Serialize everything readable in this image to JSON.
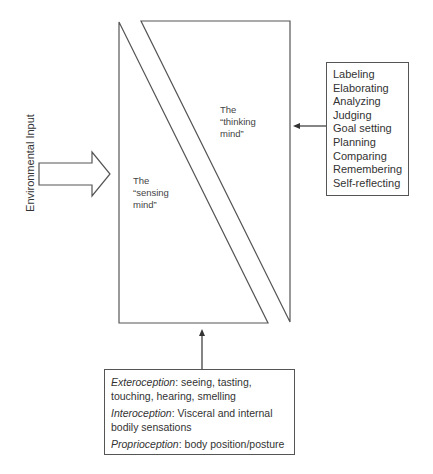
{
  "diagram": {
    "type": "conceptual-mind-model",
    "environmental_input": {
      "label": "Environmental Input"
    },
    "sensing_mind": {
      "line1": "The",
      "line2": "“sensing",
      "line3": "mind”"
    },
    "thinking_mind": {
      "line1": "The",
      "line2": "“thinking",
      "line3": "mind”"
    },
    "thinking_processes": {
      "items": [
        "Labeling",
        "Elaborating",
        "Analyzing",
        "Judging",
        "Goal setting",
        "Planning",
        "Comparing",
        "Remembering",
        "Self-reflecting"
      ]
    },
    "sensory_inputs": {
      "entries": [
        {
          "term": "Exteroception",
          "sep": ":",
          "text1": " seeing, tasting,",
          "text2": "touching, hearing, smelling"
        },
        {
          "term": "Interoception",
          "sep": ":",
          "text1": " Visceral and internal",
          "text2": "bodily sensations"
        },
        {
          "term": "Proprioception",
          "sep": ":",
          "text1": " body position/posture",
          "text2": ""
        }
      ]
    },
    "colors": {
      "stroke": "#555555",
      "text": "#333333",
      "background": "#ffffff"
    }
  }
}
